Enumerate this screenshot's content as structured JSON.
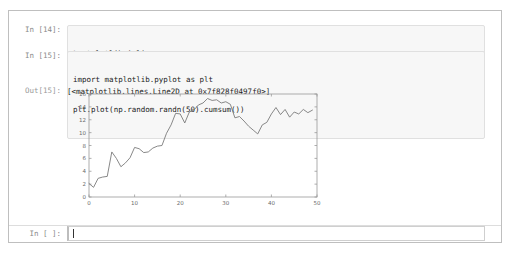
{
  "notebook": {
    "cells": [
      {
        "type": "input",
        "prompt": "In [14]:",
        "lines": [
          "%matplotlib inline"
        ]
      },
      {
        "type": "input",
        "prompt": "In [15]:",
        "lines": [
          "import matplotlib.pyplot as plt",
          "plt.plot(np.random.randn(50).cumsum())"
        ]
      },
      {
        "type": "output",
        "prompt": "Out[15]:",
        "text": "[<matplotlib.lines.Line2D at 0x7f828f0497f0>]"
      }
    ],
    "bottom_cell": {
      "prompt": "In [ ]:",
      "value": ""
    },
    "colors": {
      "frame_border": "#bfbfbf",
      "input_bg": "#f7f7f7",
      "input_border": "#e0e0e0",
      "prompt_text": "#8a8a8a",
      "code_text": "#1a1a1a",
      "line_color": "#7a7a7a",
      "axis_color": "#9a9a9a"
    }
  },
  "chart_data": {
    "type": "line",
    "title": "",
    "xlabel": "",
    "ylabel": "",
    "xlim": [
      0,
      50
    ],
    "ylim": [
      0,
      16
    ],
    "xticks": [
      0,
      10,
      20,
      30,
      40,
      50
    ],
    "yticks": [
      0,
      2,
      4,
      6,
      8,
      10,
      12,
      14,
      16
    ],
    "grid": false,
    "legend": "none",
    "series": [
      {
        "name": "np.random.randn(50).cumsum()",
        "x": [
          0,
          1,
          2,
          3,
          4,
          5,
          6,
          7,
          8,
          9,
          10,
          11,
          12,
          13,
          14,
          15,
          16,
          17,
          18,
          19,
          20,
          21,
          22,
          23,
          24,
          25,
          26,
          27,
          28,
          29,
          30,
          31,
          32,
          33,
          34,
          35,
          36,
          37,
          38,
          39,
          40,
          41,
          42,
          43,
          44,
          45,
          46,
          47,
          48,
          49
        ],
        "values": [
          2.1,
          1.5,
          2.9,
          3.1,
          3.2,
          7.0,
          6.0,
          4.7,
          5.3,
          6.1,
          7.7,
          7.5,
          6.9,
          7.0,
          7.6,
          7.9,
          8.0,
          9.9,
          11.2,
          13.0,
          12.9,
          11.5,
          13.2,
          13.5,
          14.3,
          14.6,
          15.3,
          15.0,
          15.1,
          14.6,
          14.8,
          14.4,
          12.3,
          12.5,
          11.8,
          11.0,
          10.4,
          9.8,
          11.2,
          11.6,
          12.9,
          13.9,
          12.8,
          13.6,
          12.4,
          13.2,
          12.9,
          13.6,
          13.1,
          13.5
        ]
      }
    ]
  }
}
